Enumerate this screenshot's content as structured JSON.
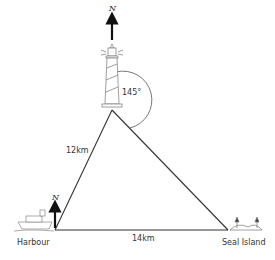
{
  "diagram": {
    "type": "bearing-triangle",
    "points": {
      "lighthouse": {
        "label": "",
        "x": 112,
        "y": 110
      },
      "harbour": {
        "label": "Harbour",
        "x": 55,
        "y": 230
      },
      "seal_island": {
        "label": "Seal Island",
        "x": 228,
        "y": 230
      }
    },
    "edges": [
      {
        "from": "harbour",
        "to": "lighthouse",
        "label": "12km"
      },
      {
        "from": "harbour",
        "to": "seal_island",
        "label": "14km"
      },
      {
        "from": "lighthouse",
        "to": "seal_island",
        "label": ""
      }
    ],
    "angle": {
      "at": "lighthouse",
      "label": "145°"
    },
    "north_label": "N",
    "icons": [
      "lighthouse-icon",
      "ship-icon",
      "island-icon",
      "north-arrow-icon"
    ]
  }
}
